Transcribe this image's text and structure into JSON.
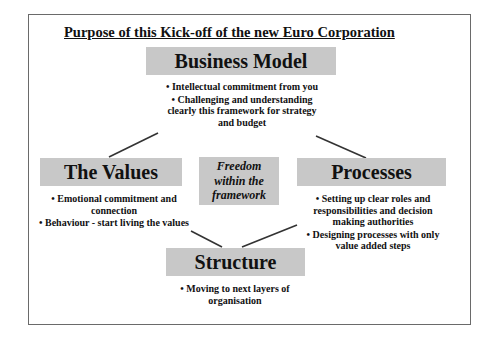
{
  "slide": {
    "title": "Purpose of this Kick-off of  the new Euro Corporation",
    "center": {
      "label": "Freedom within the framework"
    },
    "nodes": {
      "business_model": {
        "label": "Business Model",
        "bullets": [
          "• Intellectual commitment from you",
          "• Challenging and understanding clearly this framework for strategy and budget"
        ]
      },
      "values": {
        "label": "The Values",
        "bullets": [
          "• Emotional commitment and connection",
          "• Behaviour - start living the values"
        ]
      },
      "processes": {
        "label": "Processes",
        "bullets": [
          "• Setting up clear roles and responsibilities and decision making authorities",
          "• Designing processes with only value added steps"
        ]
      },
      "structure": {
        "label": "Structure",
        "bullets": [
          "• Moving to next layers of organisation"
        ]
      }
    },
    "connectors": [
      {
        "from": "business_model",
        "to": "values"
      },
      {
        "from": "business_model",
        "to": "processes"
      },
      {
        "from": "values",
        "to": "structure"
      },
      {
        "from": "processes",
        "to": "structure"
      }
    ],
    "colors": {
      "box_fill": "#c8c8c8",
      "line": "#333333",
      "frame": "#6a6a6a"
    }
  }
}
